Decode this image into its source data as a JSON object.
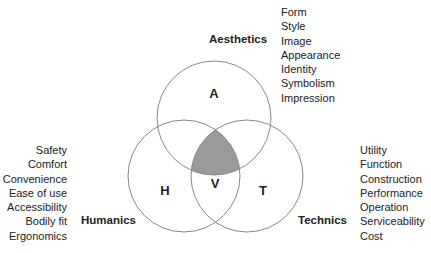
{
  "diagram": {
    "type": "venn",
    "colors": {
      "stroke": "#888888",
      "intersection_fill": "#9a9a9a",
      "text": "#222222",
      "background": "#ffffff"
    },
    "circles": [
      {
        "id": "A",
        "label": "A",
        "category": "Aesthetics",
        "cx": 214,
        "cy": 118,
        "r": 57
      },
      {
        "id": "H",
        "label": "H",
        "category": "Humanics",
        "cx": 184,
        "cy": 176,
        "r": 56
      },
      {
        "id": "T",
        "label": "T",
        "category": "Technics",
        "cx": 247,
        "cy": 176,
        "r": 56
      }
    ],
    "center": {
      "label": "V"
    }
  },
  "aesthetics": {
    "title": "Aesthetics",
    "items": [
      "Form",
      "Style",
      "Image",
      "Appearance",
      "Identity",
      "Symbolism",
      "Impression"
    ]
  },
  "humanics": {
    "title": "Humanics",
    "items": [
      "Safety",
      "Comfort",
      "Convenience",
      "Ease of use",
      "Accessibility",
      "Bodily fit",
      "Ergonomics"
    ]
  },
  "technics": {
    "title": "Technics",
    "items": [
      "Utility",
      "Function",
      "Construction",
      "Performance",
      "Operation",
      "Serviceability",
      "Cost"
    ]
  }
}
